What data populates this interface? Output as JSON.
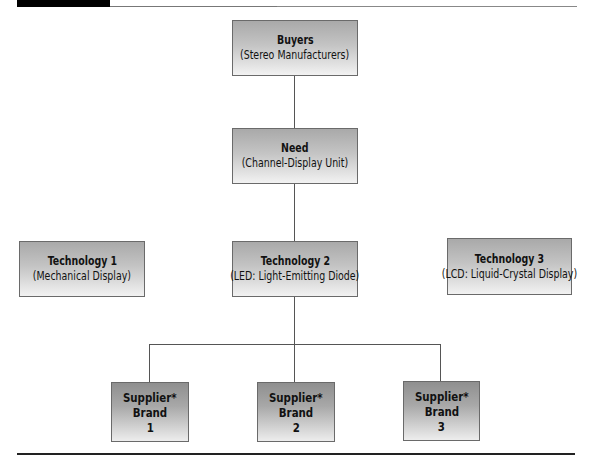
{
  "diagram": {
    "type": "hierarchy",
    "nodes": {
      "buyers": {
        "title": "Buyers",
        "subtitle": "(Stereo Manufacturers)"
      },
      "need": {
        "title": "Need",
        "subtitle": "(Channel-Display Unit)"
      },
      "technologies": [
        {
          "title": "Technology 1",
          "subtitle": "(Mechanical Display)"
        },
        {
          "title": "Technology 2",
          "subtitle": "(LED: Light-Emitting Diode)"
        },
        {
          "title": "Technology 3",
          "subtitle": "(LCD: Liquid-Crystal Display)"
        }
      ],
      "suppliers": [
        {
          "line1": "Supplier*",
          "line2": "Brand",
          "line3": "1"
        },
        {
          "line1": "Supplier*",
          "line2": "Brand",
          "line3": "2"
        },
        {
          "line1": "Supplier*",
          "line2": "Brand",
          "line3": "3"
        }
      ]
    },
    "edges": [
      [
        "buyers",
        "need"
      ],
      [
        "need",
        "technology-2"
      ],
      [
        "technology-2",
        "supplier-1"
      ],
      [
        "technology-2",
        "supplier-2"
      ],
      [
        "technology-2",
        "supplier-3"
      ]
    ],
    "colors": {
      "box_top": "#a9a9a9",
      "box_bottom": "#f2f2f2",
      "border": "#6a6a6a",
      "connector": "#555555",
      "rule": "#222222"
    }
  }
}
